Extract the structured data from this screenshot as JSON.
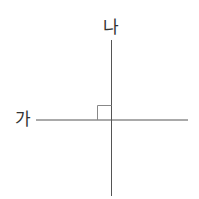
{
  "diagram": {
    "labels": {
      "horizontal_line": "가",
      "vertical_line": "나"
    },
    "line_color": "#555555",
    "marker_color": "#888888",
    "right_angle_marker": true
  }
}
